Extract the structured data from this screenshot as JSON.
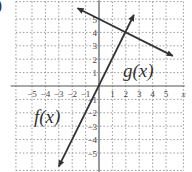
{
  "figure": {
    "part_label": ")",
    "f_label": "f(x)",
    "g_label": "g(x)",
    "x_axis_label": "x"
  },
  "chart_data": {
    "type": "line",
    "title": "",
    "xlabel": "x",
    "ylabel": "",
    "xlim": [
      -6,
      6
    ],
    "ylim": [
      -6,
      6
    ],
    "grid": true,
    "grid_style": "dotted",
    "x_ticks": [
      -5,
      -4,
      -3,
      -2,
      -1,
      1,
      2,
      3,
      4,
      5
    ],
    "y_ticks": [
      5,
      4,
      3,
      2,
      1,
      -1,
      -2,
      -3,
      -4,
      -5
    ],
    "series": [
      {
        "name": "f(x)",
        "equation": "f(x) = 2x",
        "x": [
          -3,
          2.6
        ],
        "y": [
          -6,
          5.3
        ],
        "arrows": "both"
      },
      {
        "name": "g(x)",
        "equation": "g(x) = -0.5x + 5",
        "x": [
          -1.6,
          5.5
        ],
        "y": [
          5.8,
          2.25
        ],
        "arrows": "both"
      }
    ],
    "annotations": [
      {
        "text": "f(x)",
        "x": -4,
        "y": -1.5
      },
      {
        "text": "g(x)",
        "x": 3,
        "y": 1.5
      }
    ],
    "intersection": {
      "x": 2,
      "y": 4
    },
    "line_color": "#333333",
    "grid_color": "#9a9a9a",
    "axis_color": "#555555"
  }
}
